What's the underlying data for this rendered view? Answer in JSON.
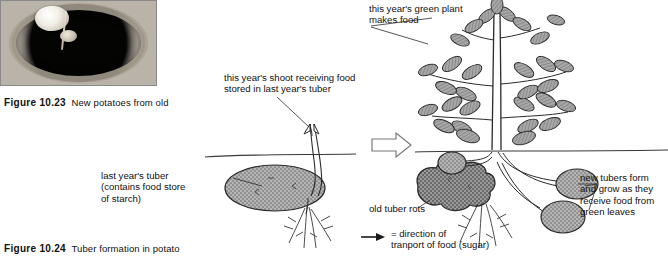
{
  "figure_photo": {
    "caption_number": "Figure 10.23",
    "caption_text": "New potatoes from old",
    "alt": "photograph of a dark old potato cut open showing pale new potatoes inside"
  },
  "figure_diagram": {
    "caption_number": "Figure 10.24",
    "caption_text": "Tuber formation in potato"
  },
  "labels": {
    "shoot": "this year's shoot receiving food\nstored in last year's tuber",
    "green_plant": "this year's green plant\nmakes food",
    "last_year_tuber": "last year's tuber\n(contains food store\nof starch)",
    "old_tuber_rots": "old tuber rots",
    "new_tubers": "new tubers form\nand grow as they\nreceive food from\ngreen leaves"
  },
  "key": {
    "arrow_icon": "right-arrow-icon",
    "text": "= direction of\n   tranport of food (sugar)"
  },
  "diagram_parts": {
    "left_stage": {
      "tuber": "old-tuber-ellipse",
      "shoot": "emerging-shoot",
      "roots": "root-system",
      "soil_line": "soil-surface-line"
    },
    "transition": "stage-transition-arrow",
    "right_stage": {
      "plant": "green-leafy-plant",
      "rotting_tuber": "rotting-old-tuber",
      "new_tubers": [
        "new-tuber-upper-left",
        "new-tuber-right-upper",
        "new-tuber-right-lower"
      ],
      "soil_line": "soil-surface-line"
    }
  },
  "colors": {
    "ink": "#1a1a1a",
    "tuber_fill": "#9e9e9e",
    "leaf_fill": "#8f8f8f",
    "rot_fill": "#858585",
    "line": "#2b2b2b"
  }
}
